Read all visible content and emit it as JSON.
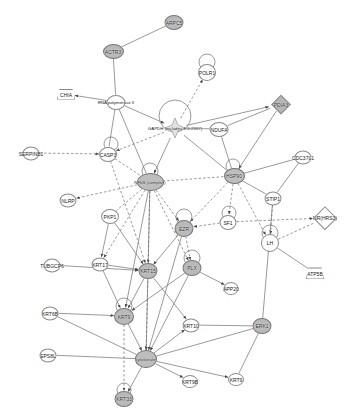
{
  "diagram": {
    "type": "biological-interaction-network",
    "background": "#ffffff",
    "edge_color": "#6f6f6f",
    "node_fill_light": "#ffffff",
    "node_fill_shaded": "#bdbdbd",
    "node_stroke": "#8a8a8a"
  },
  "nodes": [
    {
      "id": "arpc5",
      "label": "ARPC5",
      "x": 174,
      "y": 22,
      "w": 17,
      "h": 13,
      "shape": "ellipse",
      "fill": "shaded"
    },
    {
      "id": "actr3",
      "label": "ACTR3",
      "x": 113,
      "y": 51,
      "w": 19,
      "h": 13,
      "shape": "ellipse",
      "fill": "shaded"
    },
    {
      "id": "polr1",
      "label": "POLR1",
      "x": 207,
      "y": 72,
      "w": 16,
      "h": 15,
      "shape": "ellipse",
      "fill": "light"
    },
    {
      "id": "chia",
      "label": "CHIA",
      "x": 66,
      "y": 94,
      "w": 16,
      "h": 9,
      "shape": "trapezoid",
      "fill": "light"
    },
    {
      "id": "rnapol2",
      "label": "RNA polymerase II",
      "x": 116,
      "y": 102,
      "w": 17,
      "h": 13,
      "shape": "ellipse",
      "fill": "light"
    },
    {
      "id": "pdia3",
      "label": "PDIA3",
      "x": 281,
      "y": 104,
      "w": 24,
      "h": 13,
      "shape": "diamond",
      "fill": "shaded"
    },
    {
      "id": "gapdh",
      "label": "GAPDH (includes EG:2597)",
      "x": 175,
      "y": 128,
      "w": 22,
      "h": 20,
      "shape": "star",
      "fill": "light"
    },
    {
      "id": "ndufa",
      "label": "NDUFA",
      "x": 219,
      "y": 129,
      "w": 17,
      "h": 13,
      "shape": "ellipse",
      "fill": "light"
    },
    {
      "id": "serpinb1",
      "label": "SERPINB1",
      "x": 31,
      "y": 153,
      "w": 15,
      "h": 12,
      "shape": "ellipse",
      "fill": "light"
    },
    {
      "id": "casp3",
      "label": "CASP3",
      "x": 108,
      "y": 154,
      "w": 16,
      "h": 13,
      "shape": "ellipse",
      "fill": "light"
    },
    {
      "id": "cdc37l1",
      "label": "CDC37L1",
      "x": 303,
      "y": 157,
      "w": 15,
      "h": 12,
      "shape": "ellipse",
      "fill": "light"
    },
    {
      "id": "nfkb",
      "label": "NFkB (complex)",
      "x": 150,
      "y": 182,
      "w": 25,
      "h": 16,
      "shape": "hoval",
      "fill": "shaded"
    },
    {
      "id": "hsp90",
      "label": "HSP90",
      "x": 234,
      "y": 176,
      "w": 19,
      "h": 14,
      "shape": "hoval",
      "fill": "shaded"
    },
    {
      "id": "nlrp",
      "label": "NLRP",
      "x": 68,
      "y": 200,
      "w": 15,
      "h": 12,
      "shape": "ellipse",
      "fill": "light"
    },
    {
      "id": "stip1",
      "label": "STIP1",
      "x": 273,
      "y": 198,
      "w": 15,
      "h": 12,
      "shape": "ellipse",
      "fill": "light"
    },
    {
      "id": "pkp1",
      "label": "PKP1",
      "x": 110,
      "y": 216,
      "w": 16,
      "h": 13,
      "shape": "ellipse",
      "fill": "light"
    },
    {
      "id": "ezr",
      "label": "EZR",
      "x": 184,
      "y": 228,
      "w": 17,
      "h": 15,
      "shape": "ellipse",
      "fill": "shaded"
    },
    {
      "id": "sf1",
      "label": "SF1",
      "x": 228,
      "y": 222,
      "w": 15,
      "h": 13,
      "shape": "ellipse",
      "fill": "light"
    },
    {
      "id": "hrs3",
      "label": "NR(HRS3)",
      "x": 325,
      "y": 218,
      "w": 22,
      "h": 16,
      "shape": "diamond",
      "fill": "light"
    },
    {
      "id": "lh",
      "label": "LH",
      "x": 270,
      "y": 243,
      "w": 16,
      "h": 16,
      "shape": "ellipse",
      "fill": "light"
    },
    {
      "id": "tubgcp6",
      "label": "TUBGCP6",
      "x": 52,
      "y": 265,
      "w": 15,
      "h": 12,
      "shape": "ellipse",
      "fill": "light"
    },
    {
      "id": "krt17",
      "label": "KRT17",
      "x": 100,
      "y": 264,
      "w": 15,
      "h": 12,
      "shape": "ellipse",
      "fill": "light"
    },
    {
      "id": "krt15",
      "label": "KRT15",
      "x": 148,
      "y": 271,
      "w": 17,
      "h": 14,
      "shape": "ellipse",
      "fill": "shaded"
    },
    {
      "id": "plx",
      "label": "PLX",
      "x": 192,
      "y": 268,
      "w": 17,
      "h": 14,
      "shape": "ellipse",
      "fill": "shaded"
    },
    {
      "id": "app20",
      "label": "APP20",
      "x": 231,
      "y": 288,
      "w": 13,
      "h": 11,
      "shape": "ellipse",
      "fill": "light"
    },
    {
      "id": "atp5b",
      "label": "ATP5B",
      "x": 315,
      "y": 273,
      "w": 16,
      "h": 10,
      "shape": "trapezoid",
      "fill": "light"
    },
    {
      "id": "krt6b",
      "label": "KRT6B",
      "x": 50,
      "y": 313,
      "w": 15,
      "h": 12,
      "shape": "ellipse",
      "fill": "light"
    },
    {
      "id": "krt9c",
      "label": "KRT9",
      "x": 124,
      "y": 316,
      "w": 18,
      "h": 15,
      "shape": "ellipse",
      "fill": "shaded"
    },
    {
      "id": "krt10",
      "label": "KRT10",
      "x": 191,
      "y": 325,
      "w": 15,
      "h": 12,
      "shape": "ellipse",
      "fill": "light"
    },
    {
      "id": "erk1",
      "label": "ERK1",
      "x": 262,
      "y": 326,
      "w": 17,
      "h": 14,
      "shape": "ellipse",
      "fill": "shaded"
    },
    {
      "id": "eps8l",
      "label": "EPS8L",
      "x": 48,
      "y": 355,
      "w": 15,
      "h": 12,
      "shape": "ellipse",
      "fill": "light"
    },
    {
      "id": "keratin",
      "label": "cytokeratin",
      "x": 146,
      "y": 359,
      "w": 20,
      "h": 16,
      "shape": "hoval",
      "fill": "shaded"
    },
    {
      "id": "krt9b",
      "label": "KRT9B",
      "x": 190,
      "y": 381,
      "w": 14,
      "h": 11,
      "shape": "ellipse",
      "fill": "light"
    },
    {
      "id": "krt9",
      "label": "KRT9",
      "x": 236,
      "y": 379,
      "w": 14,
      "h": 11,
      "shape": "ellipse",
      "fill": "light"
    },
    {
      "id": "krt33",
      "label": "KRT33",
      "x": 124,
      "y": 399,
      "w": 17,
      "h": 14,
      "shape": "ellipse",
      "fill": "shaded"
    }
  ],
  "edges": [
    {
      "from": "arpc5",
      "to": "actr3",
      "style": "solid",
      "arrow": "none"
    },
    {
      "from": "actr3",
      "to": "rnapol2",
      "style": "solid",
      "arrow": "none"
    },
    {
      "from": "rnapol2",
      "to": "chia",
      "style": "solid",
      "arrow": "end"
    },
    {
      "from": "rnapol2",
      "to": "gapdh",
      "style": "solid",
      "arrow": "end"
    },
    {
      "from": "rnapol2",
      "to": "casp3",
      "style": "solid",
      "arrow": "none"
    },
    {
      "from": "rnapol2",
      "to": "nfkb",
      "style": "solid",
      "arrow": "none"
    },
    {
      "from": "gapdh",
      "to": "polr1",
      "style": "dashed",
      "arrow": "end"
    },
    {
      "from": "gapdh",
      "to": "ndufa",
      "style": "solid",
      "arrow": "none"
    },
    {
      "from": "gapdh",
      "to": "pdia3",
      "style": "solid",
      "arrow": "end"
    },
    {
      "from": "gapdh",
      "to": "nfkb",
      "style": "solid",
      "arrow": "end"
    },
    {
      "from": "gapdh",
      "to": "hsp90",
      "style": "solid",
      "arrow": "none"
    },
    {
      "from": "gapdh",
      "to": "casp3",
      "style": "dashed",
      "arrow": "end"
    },
    {
      "from": "ndufa",
      "to": "pdia3",
      "style": "solid",
      "arrow": "none"
    },
    {
      "from": "ndufa",
      "to": "hsp90",
      "style": "solid",
      "arrow": "none"
    },
    {
      "from": "pdia3",
      "to": "hsp90",
      "style": "solid",
      "arrow": "end"
    },
    {
      "from": "serpinb1",
      "to": "casp3",
      "style": "dashed",
      "arrow": "end"
    },
    {
      "from": "casp3",
      "to": "nfkb",
      "style": "dashed",
      "arrow": "none"
    },
    {
      "from": "casp3",
      "to": "krt15",
      "style": "dashed",
      "arrow": "end"
    },
    {
      "from": "cdc37l1",
      "to": "hsp90",
      "style": "solid",
      "arrow": "none"
    },
    {
      "from": "cdc37l1",
      "to": "stip1",
      "style": "solid",
      "arrow": "none"
    },
    {
      "from": "hsp90",
      "to": "stip1",
      "style": "solid",
      "arrow": "none"
    },
    {
      "from": "hsp90",
      "to": "nfkb",
      "style": "dashed",
      "arrow": "none"
    },
    {
      "from": "hsp90",
      "to": "sf1",
      "style": "dashed",
      "arrow": "end"
    },
    {
      "from": "hsp90",
      "to": "lh",
      "style": "dashed",
      "arrow": "end"
    },
    {
      "from": "hsp90",
      "to": "ezr",
      "style": "dashed",
      "arrow": "end"
    },
    {
      "from": "nfkb",
      "to": "nlrp",
      "style": "dashed",
      "arrow": "end"
    },
    {
      "from": "nfkb",
      "to": "pkp1",
      "style": "dashed",
      "arrow": "none"
    },
    {
      "from": "nfkb",
      "to": "ezr",
      "style": "dashed",
      "arrow": "end"
    },
    {
      "from": "nfkb",
      "to": "krt15",
      "style": "solid",
      "arrow": "end"
    },
    {
      "from": "nfkb",
      "to": "krt9c",
      "style": "solid",
      "arrow": "end"
    },
    {
      "from": "nfkb",
      "to": "keratin",
      "style": "dashed",
      "arrow": "end"
    },
    {
      "from": "nfkb",
      "to": "plx",
      "style": "dashed",
      "arrow": "end"
    },
    {
      "from": "nfkb",
      "to": "krt17",
      "style": "dashed",
      "arrow": "end"
    },
    {
      "from": "stip1",
      "to": "lh",
      "style": "dashed",
      "arrow": "end"
    },
    {
      "from": "stip1",
      "to": "erk1",
      "style": "solid",
      "arrow": "none"
    },
    {
      "from": "sf1",
      "to": "ezr",
      "style": "dashed",
      "arrow": "end"
    },
    {
      "from": "sf1",
      "to": "hrs3",
      "style": "dashed",
      "arrow": "end"
    },
    {
      "from": "lh",
      "to": "hrs3",
      "style": "dashed",
      "arrow": "none"
    },
    {
      "from": "lh",
      "to": "atp5b",
      "style": "solid",
      "arrow": "none"
    },
    {
      "from": "ezr",
      "to": "plx",
      "style": "dashed",
      "arrow": "end"
    },
    {
      "from": "ezr",
      "to": "krt15",
      "style": "solid",
      "arrow": "end"
    },
    {
      "from": "ezr",
      "to": "keratin",
      "style": "solid",
      "arrow": "end"
    },
    {
      "from": "pkp1",
      "to": "krt17",
      "style": "solid",
      "arrow": "end"
    },
    {
      "from": "pkp1",
      "to": "krt15",
      "style": "solid",
      "arrow": "end"
    },
    {
      "from": "tubgcp6",
      "to": "krt15",
      "style": "solid",
      "arrow": "end"
    },
    {
      "from": "krt17",
      "to": "krt15",
      "style": "solid",
      "arrow": "end"
    },
    {
      "from": "krt17",
      "to": "krt9c",
      "style": "solid",
      "arrow": "end"
    },
    {
      "from": "krt15",
      "to": "krt9c",
      "style": "solid",
      "arrow": "end"
    },
    {
      "from": "krt15",
      "to": "keratin",
      "style": "solid",
      "arrow": "end"
    },
    {
      "from": "krt15",
      "to": "krt10",
      "style": "solid",
      "arrow": "end"
    },
    {
      "from": "plx",
      "to": "app20",
      "style": "solid",
      "arrow": "end"
    },
    {
      "from": "plx",
      "to": "keratin",
      "style": "solid",
      "arrow": "end"
    },
    {
      "from": "plx",
      "to": "krt9c",
      "style": "solid",
      "arrow": "end"
    },
    {
      "from": "krt6b",
      "to": "krt9c",
      "style": "solid",
      "arrow": "end"
    },
    {
      "from": "krt6b",
      "to": "keratin",
      "style": "solid",
      "arrow": "none"
    },
    {
      "from": "krt9c",
      "to": "keratin",
      "style": "solid",
      "arrow": "end"
    },
    {
      "from": "krt9c",
      "to": "krt33",
      "style": "dashed",
      "arrow": "end"
    },
    {
      "from": "eps8l",
      "to": "keratin",
      "style": "solid",
      "arrow": "none"
    },
    {
      "from": "erk1",
      "to": "keratin",
      "style": "solid",
      "arrow": "none"
    },
    {
      "from": "erk1",
      "to": "krt9",
      "style": "solid",
      "arrow": "none"
    },
    {
      "from": "erk1",
      "to": "krt10",
      "style": "solid",
      "arrow": "none"
    },
    {
      "from": "keratin",
      "to": "krt9b",
      "style": "solid",
      "arrow": "end"
    },
    {
      "from": "keratin",
      "to": "krt9",
      "style": "solid",
      "arrow": "end"
    },
    {
      "from": "keratin",
      "to": "krt10",
      "style": "solid",
      "arrow": "end"
    },
    {
      "from": "keratin",
      "to": "krt33",
      "style": "solid",
      "arrow": "end"
    }
  ],
  "self_loops": [
    {
      "node": "polr1",
      "dx": 0,
      "dy": -10,
      "r": 8
    },
    {
      "node": "gapdh",
      "dx": 0,
      "dy": -12,
      "r": 16
    },
    {
      "node": "casp3",
      "dx": 3,
      "dy": -10,
      "r": 7
    },
    {
      "node": "nfkb",
      "dx": 0,
      "dy": -11,
      "r": 8
    },
    {
      "node": "hsp90",
      "dx": -1,
      "dy": -10,
      "r": 7
    },
    {
      "node": "ezr",
      "dx": 0,
      "dy": -11,
      "r": 8
    },
    {
      "node": "sf1",
      "dx": 1,
      "dy": -9,
      "r": 7
    },
    {
      "node": "lh",
      "dx": 0,
      "dy": -10,
      "r": 8
    },
    {
      "node": "plx",
      "dx": 0,
      "dy": -10,
      "r": 8
    },
    {
      "node": "krt9c",
      "dx": 0,
      "dy": -10,
      "r": 8
    },
    {
      "node": "krt33",
      "dx": 0,
      "dy": -9,
      "r": 7
    }
  ]
}
